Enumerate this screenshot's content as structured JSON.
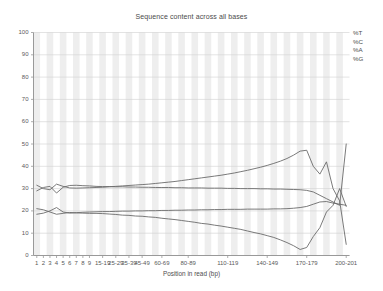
{
  "chart_data": {
    "type": "line",
    "title": "Sequence content across all bases",
    "xlabel": "Position in read (bp)",
    "ylabel": "",
    "ylim": [
      0,
      100
    ],
    "yticks": [
      0,
      10,
      20,
      30,
      40,
      50,
      60,
      70,
      80,
      90,
      100
    ],
    "grid": true,
    "legend_position": "top-right",
    "banding": true,
    "categories": [
      "1",
      "2",
      "3",
      "4",
      "5",
      "6",
      "7",
      "8",
      "9",
      "10-14",
      "15-19",
      "20-24",
      "25-29",
      "30-34",
      "35-39",
      "40-44",
      "45-49",
      "50-54",
      "55-59",
      "60-64",
      "65-69",
      "70-74",
      "75-79",
      "80-84",
      "85-89",
      "90-94",
      "95-99",
      "100-104",
      "105-109",
      "110-114",
      "115-119",
      "120-124",
      "125-129",
      "130-134",
      "135-139",
      "140-144",
      "145-149",
      "150-154",
      "155-159",
      "160-164",
      "165-169",
      "170-174",
      "175-179",
      "180-184",
      "185-189",
      "190-194",
      "195-199",
      "200-201"
    ],
    "xtick_labels": [
      "1",
      "2",
      "3",
      "4",
      "5",
      "6",
      "7",
      "8",
      "9",
      "15-19",
      "25-29",
      "35-39",
      "45-49",
      "60-69",
      "80-89",
      "110-119",
      "140-149",
      "170-179",
      "200-201"
    ],
    "xtick_indices": [
      0,
      1,
      2,
      3,
      4,
      5,
      6,
      7,
      8,
      10,
      12,
      14,
      16,
      19,
      23,
      29,
      35,
      41,
      47
    ],
    "series": [
      {
        "name": "%T",
        "color": "#6b6b6b",
        "values": [
          29.0,
          30.5,
          31.0,
          28.0,
          30.6,
          31.4,
          31.5,
          31.3,
          31.2,
          31.0,
          30.9,
          30.9,
          30.8,
          30.8,
          30.7,
          30.7,
          30.6,
          30.6,
          30.5,
          30.5,
          30.5,
          30.4,
          30.4,
          30.3,
          30.3,
          30.3,
          30.2,
          30.2,
          30.2,
          30.1,
          30.1,
          30.0,
          30.0,
          30.0,
          29.9,
          29.9,
          29.8,
          29.8,
          29.7,
          29.6,
          29.5,
          29.2,
          28.5,
          27.0,
          25.5,
          24.0,
          22.5,
          50.0
        ]
      },
      {
        "name": "%C",
        "color": "#6b6b6b",
        "values": [
          18.5,
          19.0,
          20.0,
          21.5,
          19.5,
          19.0,
          19.2,
          19.4,
          19.5,
          19.6,
          19.7,
          19.7,
          19.8,
          19.9,
          19.9,
          20.0,
          20.0,
          20.1,
          20.1,
          20.2,
          20.2,
          20.3,
          20.3,
          20.4,
          20.4,
          20.5,
          20.5,
          20.6,
          20.6,
          20.7,
          20.7,
          20.7,
          20.8,
          20.8,
          20.8,
          20.8,
          20.9,
          20.9,
          21.0,
          21.2,
          21.5,
          22.0,
          23.0,
          24.0,
          24.2,
          23.5,
          23.0,
          22.5
        ]
      },
      {
        "name": "%A",
        "color": "#6b6b6b",
        "values": [
          31.5,
          30.0,
          29.5,
          32.0,
          31.0,
          30.3,
          30.2,
          30.3,
          30.4,
          30.5,
          30.6,
          30.8,
          31.0,
          31.2,
          31.4,
          31.6,
          31.8,
          32.0,
          32.3,
          32.6,
          32.9,
          33.2,
          33.6,
          34.0,
          34.4,
          34.8,
          35.2,
          35.6,
          36.0,
          36.5,
          37.0,
          37.6,
          38.2,
          38.9,
          39.6,
          40.4,
          41.3,
          42.3,
          43.5,
          45.0,
          46.8,
          47.2,
          40.0,
          36.5,
          42.0,
          30.0,
          24.5,
          5.0
        ]
      },
      {
        "name": "%G",
        "color": "#6b6b6b",
        "values": [
          21.0,
          20.5,
          19.5,
          18.5,
          18.9,
          19.3,
          19.1,
          19.0,
          18.9,
          18.9,
          18.8,
          18.6,
          18.4,
          18.1,
          18.0,
          17.7,
          17.6,
          17.3,
          17.1,
          16.7,
          16.4,
          16.1,
          15.7,
          15.3,
          14.9,
          14.4,
          14.1,
          13.6,
          13.2,
          12.7,
          12.2,
          11.7,
          11.0,
          10.3,
          9.7,
          8.9,
          8.1,
          7.0,
          5.8,
          4.4,
          2.7,
          3.6,
          8.5,
          12.5,
          19.5,
          22.5,
          30.0,
          22.0
        ]
      }
    ]
  },
  "legend": {
    "items": [
      {
        "label": "%T"
      },
      {
        "label": "%C"
      },
      {
        "label": "%A"
      },
      {
        "label": "%G"
      }
    ]
  },
  "colors": {
    "plot_background": "#ffffff",
    "band": "#e8e8e8",
    "grid": "#d0d0d0",
    "axis": "#999999",
    "line": "#6b6b6b",
    "text": "#555555"
  }
}
